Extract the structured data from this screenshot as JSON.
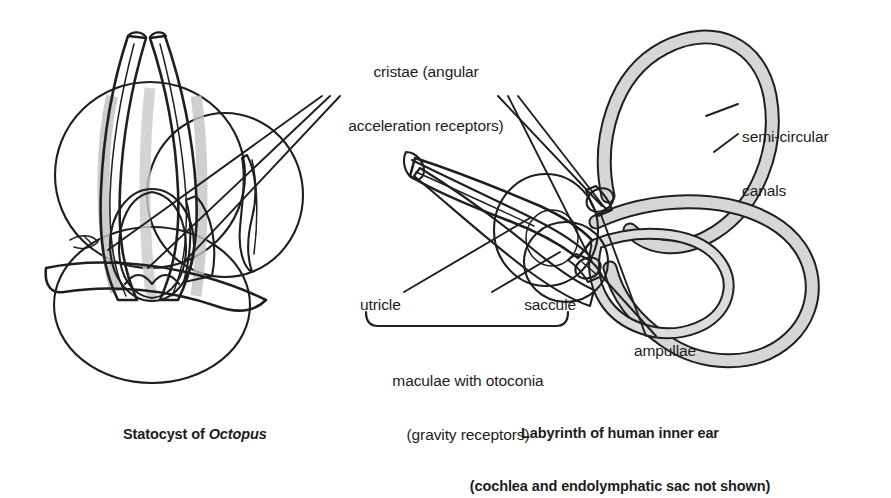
{
  "figure": {
    "background_color": "#ffffff",
    "ink_color": "#1c1c1c"
  },
  "palette": {
    "outline": "#1f1f1f",
    "tube_fill": "#a9a9a9",
    "tube_fill_light": "#c2c2c2",
    "sac_fill_light": "#ededed",
    "sac_fill_mid": "#b5b5b5",
    "core_dark": "#8d8d8d",
    "core_darker": "#7a7a7a",
    "canal_fill": "#d6d6d6"
  },
  "labels": {
    "cristae": {
      "line1": "cristae (angular",
      "line2": "acceleration receptors)"
    },
    "semicircular": {
      "line1": "semi-circular",
      "line2": "canals"
    },
    "utricle": "utricle",
    "saccule": "saccule",
    "maculae": {
      "line1": "maculae with otoconia",
      "line2": "(gravity receptors)"
    },
    "ampullae": "ampullae"
  },
  "captions": {
    "octopus": {
      "prefix": "Statocyst of ",
      "species": "Octopus"
    },
    "labyrinth": {
      "line1": "Labyrinth of human inner ear",
      "line2": "(cochlea and endolymphatic sac not shown)"
    }
  },
  "panels": [
    {
      "id": "octopus-statocyst",
      "name": "Statocyst of Octopus",
      "side": "left",
      "parts": [
        "upper-sac",
        "lower-sac",
        "crista-tubes",
        "anticrista-core",
        "macula-ring",
        "nerve-band"
      ]
    },
    {
      "id": "human-labyrinth",
      "name": "Labyrinth of human inner ear",
      "side": "right",
      "parts": [
        "anterior-semicircular-canal",
        "posterior-semicircular-canal",
        "lateral-semicircular-canal",
        "utricle",
        "saccule",
        "ampullae",
        "crista-blades"
      ]
    }
  ]
}
